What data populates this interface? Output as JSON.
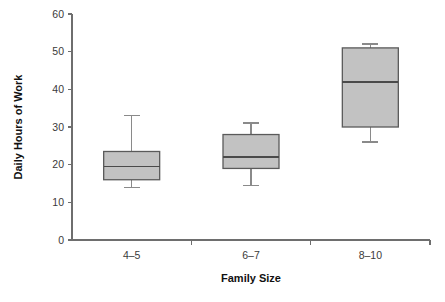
{
  "chart_data": {
    "type": "box",
    "title": "",
    "xlabel": "Family Size",
    "ylabel": "Daily Hours of Work",
    "categories": [
      "4–5",
      "6–7",
      "8–10"
    ],
    "ylim": [
      0,
      60
    ],
    "y_ticks": [
      0,
      10,
      20,
      30,
      40,
      50,
      60
    ],
    "y_tick_labels": [
      "0",
      "10",
      "20",
      "30",
      "40",
      "50",
      "60"
    ],
    "grid": false,
    "legend": "none",
    "box_fill_color": "#c2c2c2",
    "box_edge_color": "#5a5a5a",
    "whisker_color": "#8a8a8a",
    "axis_color": "#6e6e6e",
    "boxes": [
      {
        "category": "4–5",
        "whisker_low": 14,
        "q1": 16,
        "median": 19.5,
        "q3": 23.5,
        "whisker_high": 33
      },
      {
        "category": "6–7",
        "whisker_low": 14.5,
        "q1": 19,
        "median": 22,
        "q3": 28,
        "whisker_high": 31
      },
      {
        "category": "8–10",
        "whisker_low": 26,
        "q1": 30,
        "median": 42,
        "q3": 51,
        "whisker_high": 52
      }
    ]
  }
}
